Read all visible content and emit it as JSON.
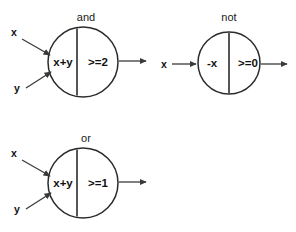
{
  "diagram": {
    "background_color": "#ffffff",
    "stroke_color": "#2b2b2b",
    "text_color": "#111111",
    "gates": [
      {
        "id": "and",
        "title": "and",
        "left_expr": "x+y",
        "right_expr": ">=2",
        "inputs": [
          {
            "label": "x",
            "label_x": 14,
            "label_y": 36,
            "x1": 22,
            "y1": 39,
            "x2": 50,
            "y2": 55
          },
          {
            "label": "y",
            "label_y": 92,
            "label_x": 17,
            "x1": 26,
            "y1": 88,
            "x2": 51,
            "y2": 72
          }
        ],
        "output": {
          "x1": 119,
          "y1": 61,
          "x2": 148,
          "y2": 61
        },
        "cx": 83,
        "cy": 62,
        "r": 35,
        "divider_x": 77,
        "title_x": 86,
        "title_y": 21
      },
      {
        "id": "not",
        "title": "not",
        "left_expr": "-x",
        "right_expr": ">=0",
        "inputs": [
          {
            "label": "x",
            "label_x": 164,
            "label_y": 68,
            "x1": 172,
            "y1": 64,
            "x2": 197,
            "y2": 64
          }
        ],
        "output": {
          "x1": 261,
          "y1": 64,
          "x2": 289,
          "y2": 64
        },
        "cx": 229,
        "cy": 63,
        "r": 31,
        "divider_x": 229,
        "title_x": 229,
        "title_y": 21
      },
      {
        "id": "or",
        "title": "or",
        "left_expr": "x+y",
        "right_expr": ">=1",
        "inputs": [
          {
            "label": "x",
            "label_x": 14,
            "label_y": 157,
            "x1": 22,
            "y1": 160,
            "x2": 50,
            "y2": 176
          },
          {
            "label": "y",
            "label_x": 17,
            "label_y": 213,
            "x1": 26,
            "y1": 209,
            "x2": 51,
            "y2": 193
          }
        ],
        "output": {
          "x1": 119,
          "y1": 182,
          "x2": 148,
          "y2": 182
        },
        "cx": 83,
        "cy": 183,
        "r": 35,
        "divider_x": 77,
        "title_x": 86,
        "title_y": 142
      }
    ]
  }
}
